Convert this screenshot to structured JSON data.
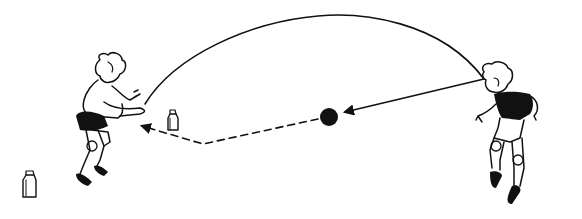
{
  "figure": {
    "colors": {
      "ink": "#111111",
      "background": "#ffffff"
    },
    "elements": {
      "left_child": {
        "role": "receiver",
        "pose": "crouched, arms forward to catch"
      },
      "right_child": {
        "role": "thrower",
        "pose": "leaning forward, dark shirt"
      },
      "ball": {
        "center": [
          329,
          117
        ],
        "radius": 9
      },
      "arc_trajectory": {
        "from": [
          484,
          79
        ],
        "peak": [
          318,
          16
        ],
        "to": [
          145,
          104
        ],
        "style": "solid curve"
      },
      "straight_throw_arrow": {
        "from": [
          484,
          79
        ],
        "to": [
          345,
          112
        ],
        "style": "solid line with arrowhead"
      },
      "dashed_return_path": {
        "points": [
          [
            329,
            117
          ],
          [
            203,
            144
          ],
          [
            140,
            126
          ]
        ],
        "style": "dashed with arrowhead"
      },
      "cartons": [
        {
          "name": "milk-carton-near",
          "x": 168,
          "y": 113
        },
        {
          "name": "milk-carton-far",
          "x": 23,
          "y": 172
        }
      ]
    }
  }
}
